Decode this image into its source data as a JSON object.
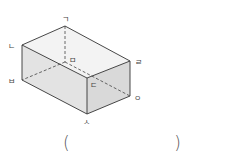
{
  "figure": {
    "type": "cuboid",
    "colors": {
      "edge": "#333333",
      "top_face": "#f3f3f3",
      "front_face": "#e3e3e3",
      "right_face": "#d9d9d9"
    },
    "vertices": {
      "giyeok": {
        "label": "ㄱ",
        "x": 65,
        "y": 26
      },
      "nieun": {
        "label": "ㄴ",
        "x": 22,
        "y": 45
      },
      "digeut": {
        "label": "ㄷ",
        "x": 87,
        "y": 78
      },
      "rieul": {
        "label": "ㄹ",
        "x": 130,
        "y": 61
      },
      "mieum": {
        "label": "ㅁ",
        "x": 65,
        "y": 62
      },
      "bieup": {
        "label": "ㅂ",
        "x": 22,
        "y": 80
      },
      "siot": {
        "label": "ㅅ",
        "x": 87,
        "y": 114
      },
      "ieung": {
        "label": "ㅇ",
        "x": 130,
        "y": 96
      }
    },
    "hidden_edges": [
      "ㄱ-ㅁ",
      "ㅁ-ㅂ",
      "ㅁ-ㅇ"
    ]
  },
  "answer": {
    "open_paren": "(",
    "value": "",
    "close_paren": ")"
  }
}
